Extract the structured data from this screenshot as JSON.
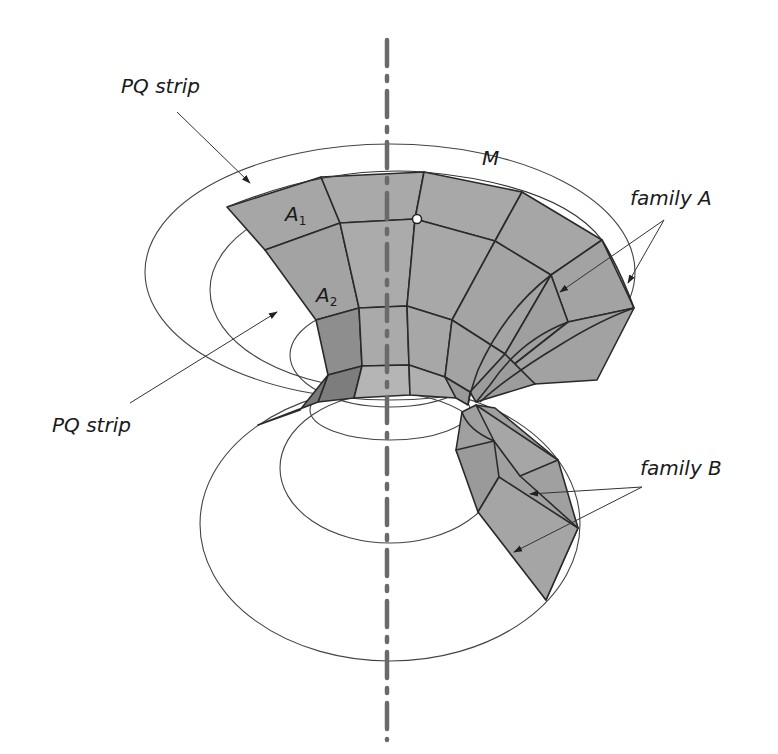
{
  "labels": {
    "pq_strip_top": "PQ strip",
    "pq_strip_left": "PQ strip",
    "m": "M",
    "family_a": "family A",
    "family_b": "family B",
    "a1_main": "A",
    "a1_sub": "1",
    "a2_main": "A",
    "a2_sub": "2"
  },
  "colors": {
    "face_fill": "#a6a6a6",
    "face_dark": "#7f7f7f",
    "edge": "#2a2a2a",
    "circle": "#444444",
    "axis": "#6a6a6a",
    "arrow": "#333333"
  }
}
